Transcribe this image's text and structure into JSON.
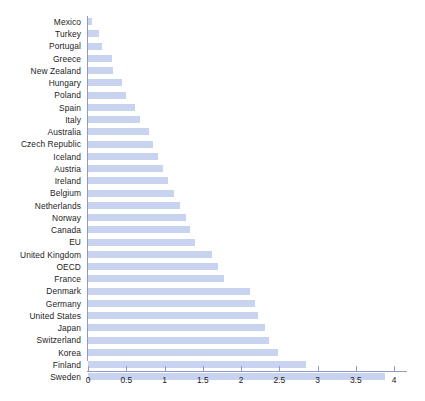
{
  "chart_data": {
    "type": "bar",
    "orientation": "horizontal",
    "title": "",
    "subtitle": "",
    "xlabel": "",
    "ylabel": "",
    "xlim": [
      0,
      4
    ],
    "ylim": null,
    "grid": false,
    "legend": null,
    "legend_position": "none",
    "bar_color": "#c8d3ef",
    "axis_color": "#8e9cc4",
    "text_color": "#1c1c1c",
    "background_color": "#ffffff",
    "xticks": [
      "0",
      "0.5",
      "1",
      "1.5",
      "2",
      "2.5",
      "3",
      "3.5",
      "4"
    ],
    "xtick_values": [
      0,
      0.5,
      1,
      1.5,
      2,
      2.5,
      3,
      3.5,
      4
    ],
    "categories": [
      "Mexico",
      "Turkey",
      "Portugal",
      "Greece",
      "New Zealand",
      "Hungary",
      "Poland",
      "Spain",
      "Italy",
      "Australia",
      "Czech Republic",
      "Iceland",
      "Austria",
      "Ireland",
      "Belgium",
      "Netherlands",
      "Norway",
      "Canada",
      "EU",
      "United Kingdom",
      "OECD",
      "France",
      "Denmark",
      "Germany",
      "United States",
      "Japan",
      "Switzerland",
      "Korea",
      "Finland",
      "Sweden"
    ],
    "values": [
      0.05,
      0.14,
      0.18,
      0.32,
      0.33,
      0.45,
      0.5,
      0.62,
      0.68,
      0.8,
      0.85,
      0.92,
      0.98,
      1.05,
      1.12,
      1.2,
      1.28,
      1.33,
      1.4,
      1.62,
      1.7,
      1.78,
      2.12,
      2.18,
      2.22,
      2.32,
      2.36,
      2.48,
      2.85,
      3.88
    ]
  }
}
